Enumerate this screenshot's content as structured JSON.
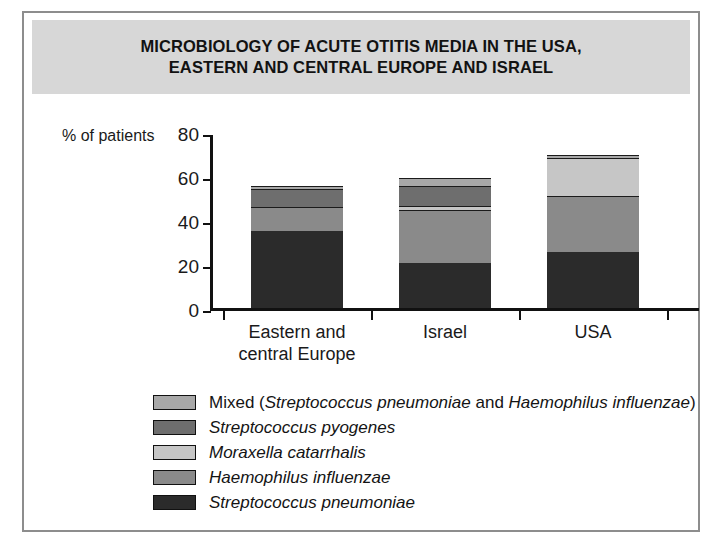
{
  "title": {
    "line1": "MICROBIOLOGY OF ACUTE OTITIS MEDIA IN THE USA,",
    "line2": "EASTERN AND CENTRAL EUROPE AND ISRAEL"
  },
  "axis": {
    "ylabel": "% of patients",
    "yticks": [
      "0",
      "20",
      "40",
      "60",
      "80"
    ]
  },
  "categories": [
    {
      "line1": "Eastern and",
      "line2": "central Europe"
    },
    {
      "line1": "Israel",
      "line2": ""
    },
    {
      "line1": "USA",
      "line2": ""
    }
  ],
  "legend": [
    {
      "label_html": "Mixed (<i>Streptococcus pneumoniae</i> and <i>Haemophilus influenzae</i>)",
      "color": "#a8a8a8"
    },
    {
      "label_html": "<i>Streptococcus pyogenes</i>",
      "color": "#6e6e6e"
    },
    {
      "label_html": "<i>Moraxella catarrhalis</i>",
      "color": "#c6c6c6"
    },
    {
      "label_html": "<i>Haemophilus influenzae</i>",
      "color": "#8a8a8a"
    },
    {
      "label_html": "<i>Streptococcus pneumoniae</i>",
      "color": "#2b2b2b"
    }
  ],
  "colors": {
    "banner": "#d7d7d7",
    "frame": "#8d8d8d",
    "axis": "#111111",
    "background": "#ffffff"
  },
  "chart_data": {
    "type": "bar",
    "title": "MICROBIOLOGY OF ACUTE OTITIS MEDIA IN THE USA, EASTERN AND CENTRAL EUROPE AND ISRAEL",
    "xlabel": "",
    "ylabel": "% of patients",
    "ylim": [
      0,
      80
    ],
    "yticks": [
      0,
      20,
      40,
      60,
      80
    ],
    "grid": false,
    "stacked": true,
    "legend_position": "bottom-left",
    "categories": [
      "Eastern and central Europe",
      "Israel",
      "USA"
    ],
    "series": [
      {
        "name": "Streptococcus pneumoniae",
        "color": "#2b2b2b",
        "values": [
          35,
          20.5,
          25.5
        ]
      },
      {
        "name": "Haemophilus influenzae",
        "color": "#8a8a8a",
        "values": [
          11,
          24,
          25.5
        ]
      },
      {
        "name": "Moraxella catarrhalis",
        "color": "#c6c6c6",
        "values": [
          0,
          2,
          17
        ]
      },
      {
        "name": "Streptococcus pyogenes",
        "color": "#6e6e6e",
        "values": [
          8,
          9,
          0
        ]
      },
      {
        "name": "Mixed (Streptococcus pneumoniae and Haemophilus influenzae)",
        "color": "#a8a8a8",
        "values": [
          1.5,
          3.5,
          1.5
        ]
      }
    ],
    "totals": [
      55.5,
      59,
      69.5
    ]
  }
}
